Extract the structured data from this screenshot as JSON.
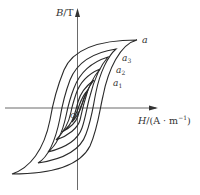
{
  "diagram": {
    "y_axis": {
      "label_var": "B",
      "label_unit": "/T"
    },
    "x_axis": {
      "label_var": "H",
      "label_unit": "/(A · m",
      "label_sup": "−1",
      "label_close": ")"
    },
    "origin_label": "O",
    "tip_labels": [
      {
        "text": "a",
        "sub": "",
        "x": 142,
        "y": 43
      },
      {
        "text": "a",
        "sub": "3",
        "x": 123,
        "y": 60
      },
      {
        "text": "a",
        "sub": "2",
        "x": 117,
        "y": 73
      },
      {
        "text": "a",
        "sub": "1",
        "x": 113,
        "y": 86
      }
    ],
    "stroke_color": "#333333"
  }
}
